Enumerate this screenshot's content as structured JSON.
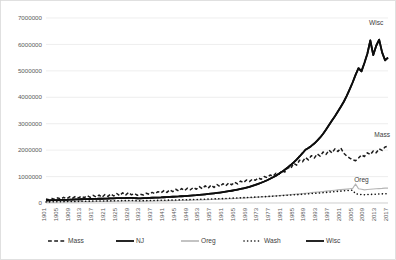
{
  "chart_data": {
    "type": "line",
    "title": "",
    "xlabel": "",
    "ylabel": "",
    "ylim": [
      0,
      7000000
    ],
    "xlim": [
      1901,
      2017
    ],
    "grid": true,
    "legend_position": "bottom",
    "ytick_labels": [
      "7000000",
      "6000000",
      "5000000",
      "4000000",
      "3000000",
      "2000000",
      "1000000",
      "0"
    ],
    "ytick_values": [
      7000000,
      6000000,
      5000000,
      4000000,
      3000000,
      2000000,
      1000000,
      0
    ],
    "xtick_labels": [
      "1901",
      "1905",
      "1909",
      "1913",
      "1917",
      "1921",
      "1925",
      "1929",
      "1933",
      "1937",
      "1941",
      "1945",
      "1949",
      "1953",
      "1957",
      "1961",
      "1965",
      "1969",
      "1973",
      "1977",
      "1981",
      "1985",
      "1989",
      "1993",
      "1997",
      "2001",
      "2005",
      "2009",
      "2013",
      "2017"
    ],
    "xtick_values": [
      1901,
      1905,
      1909,
      1913,
      1917,
      1921,
      1925,
      1929,
      1933,
      1937,
      1941,
      1945,
      1949,
      1953,
      1957,
      1961,
      1965,
      1969,
      1973,
      1977,
      1981,
      1985,
      1989,
      1993,
      1997,
      2001,
      2005,
      2009,
      2013,
      2017
    ],
    "x": [
      1901,
      1902,
      1903,
      1904,
      1905,
      1906,
      1907,
      1908,
      1909,
      1910,
      1911,
      1912,
      1913,
      1914,
      1915,
      1916,
      1917,
      1918,
      1919,
      1920,
      1921,
      1922,
      1923,
      1924,
      1925,
      1926,
      1927,
      1928,
      1929,
      1930,
      1931,
      1932,
      1933,
      1934,
      1935,
      1936,
      1937,
      1938,
      1939,
      1940,
      1941,
      1942,
      1943,
      1944,
      1945,
      1946,
      1947,
      1948,
      1949,
      1950,
      1951,
      1952,
      1953,
      1954,
      1955,
      1956,
      1957,
      1958,
      1959,
      1960,
      1961,
      1962,
      1963,
      1964,
      1965,
      1966,
      1967,
      1968,
      1969,
      1970,
      1971,
      1972,
      1973,
      1974,
      1975,
      1976,
      1977,
      1978,
      1979,
      1980,
      1981,
      1982,
      1983,
      1984,
      1985,
      1986,
      1987,
      1988,
      1989,
      1990,
      1991,
      1992,
      1993,
      1994,
      1995,
      1996,
      1997,
      1998,
      1999,
      2000,
      2001,
      2002,
      2003,
      2004,
      2005,
      2006,
      2007,
      2008,
      2009,
      2010,
      2011,
      2012,
      2013,
      2014,
      2015,
      2016,
      2017
    ],
    "series": [
      {
        "name": "Mass",
        "legend_label": "Mass",
        "inline_label": "Mass",
        "color": "#1a1a1a",
        "style": "dashed",
        "width": 1.5,
        "values": [
          150000,
          120000,
          175000,
          130000,
          195000,
          150000,
          215000,
          160000,
          235000,
          180000,
          250000,
          195000,
          260000,
          200000,
          275000,
          215000,
          290000,
          230000,
          300000,
          215000,
          320000,
          250000,
          345000,
          265000,
          360000,
          280000,
          385000,
          300000,
          400000,
          310000,
          360000,
          290000,
          330000,
          300000,
          370000,
          330000,
          400000,
          350000,
          430000,
          380000,
          470000,
          400000,
          500000,
          430000,
          520000,
          450000,
          545000,
          470000,
          560000,
          500000,
          590000,
          520000,
          620000,
          540000,
          650000,
          560000,
          680000,
          590000,
          700000,
          620000,
          730000,
          650000,
          760000,
          690000,
          790000,
          720000,
          830000,
          770000,
          870000,
          810000,
          900000,
          860000,
          950000,
          900000,
          1000000,
          960000,
          1060000,
          1010000,
          1130000,
          1090000,
          1220000,
          1170000,
          1340000,
          1300000,
          1500000,
          1430000,
          1620000,
          1560000,
          1720000,
          1630000,
          1790000,
          1700000,
          1860000,
          1770000,
          1930000,
          1840000,
          2000000,
          1890000,
          2050000,
          1950000,
          2080000,
          1880000,
          1780000,
          1700000,
          1640000,
          1600000,
          1700000,
          1820000,
          1760000,
          1900000,
          1830000,
          1970000,
          1900000,
          2050000,
          1990000,
          2120000,
          2150000
        ]
      },
      {
        "name": "NJ",
        "legend_label": "NJ",
        "inline_label": "",
        "color": "#0d0d0d",
        "style": "solid",
        "width": 1.8,
        "values": [
          95000,
          100000,
          105000,
          110000,
          112000,
          116000,
          120000,
          122000,
          128000,
          130000,
          135000,
          138000,
          142000,
          145000,
          148000,
          152000,
          156000,
          158000,
          162000,
          160000,
          168000,
          170000,
          175000,
          178000,
          182000,
          185000,
          188000,
          190000,
          195000,
          192000,
          185000,
          180000,
          178000,
          182000,
          188000,
          192000,
          198000,
          200000,
          205000,
          210000,
          218000,
          222000,
          230000,
          236000,
          242000,
          248000,
          256000,
          262000,
          270000,
          278000,
          288000,
          296000,
          308000,
          318000,
          330000,
          342000,
          356000,
          368000,
          382000,
          396000,
          412000,
          428000,
          446000,
          464000,
          484000,
          506000,
          530000,
          556000,
          584000,
          614000,
          648000,
          684000,
          724000,
          766000,
          812000,
          862000,
          916000,
          974000,
          1036000,
          1104000,
          1178000,
          1258000,
          1344000,
          1436000,
          1536000,
          1644000,
          1760000,
          1884000,
          2016000,
          2080000,
          2160000,
          2250000,
          2360000,
          2480000,
          2620000,
          2780000,
          2950000,
          3120000,
          3280000,
          3460000,
          3640000,
          3830000,
          4050000,
          4300000,
          4560000,
          4850000,
          5100000,
          4980000,
          5300000,
          5650000,
          6150000,
          5600000,
          5950000,
          6180000,
          5700000,
          5400000,
          5500000
        ]
      },
      {
        "name": "Oreg",
        "legend_label": "Oreg",
        "inline_label": "Oreg",
        "color": "#b5b5b5",
        "style": "solid",
        "width": 1.2,
        "values": [
          30000,
          32000,
          34000,
          35000,
          37000,
          38000,
          40000,
          41000,
          43000,
          44000,
          46000,
          47000,
          49000,
          50000,
          52000,
          53000,
          55000,
          56000,
          58000,
          57000,
          60000,
          61000,
          63000,
          64000,
          66000,
          67000,
          69000,
          70000,
          72000,
          71000,
          68000,
          66000,
          65000,
          67000,
          69000,
          71000,
          73000,
          75000,
          77000,
          79000,
          82000,
          84000,
          87000,
          89000,
          92000,
          94000,
          97000,
          100000,
          103000,
          106000,
          110000,
          113000,
          117000,
          120000,
          124000,
          128000,
          132000,
          136000,
          140000,
          145000,
          150000,
          155000,
          160000,
          165000,
          170000,
          176000,
          182000,
          188000,
          194000,
          200000,
          207000,
          214000,
          221000,
          228000,
          236000,
          244000,
          252000,
          260000,
          269000,
          278000,
          287000,
          296000,
          306000,
          316000,
          326000,
          336000,
          346000,
          357000,
          368000,
          379000,
          390000,
          400000,
          412000,
          424000,
          436000,
          448000,
          460000,
          470000,
          482000,
          494000,
          505000,
          516000,
          528000,
          540000,
          550000,
          720000,
          540000,
          520000,
          500000,
          510000,
          520000,
          530000,
          540000,
          545000,
          550000,
          560000,
          565000
        ]
      },
      {
        "name": "Wash",
        "legend_label": "Wash",
        "inline_label": "",
        "color": "#111111",
        "style": "dotted",
        "width": 1.6,
        "values": [
          40000,
          42000,
          44000,
          46000,
          48000,
          50000,
          52000,
          54000,
          56000,
          58000,
          60000,
          62000,
          64000,
          66000,
          68000,
          70000,
          72000,
          74000,
          76000,
          75000,
          78000,
          80000,
          82000,
          84000,
          86000,
          88000,
          90000,
          92000,
          94000,
          93000,
          90000,
          88000,
          87000,
          89000,
          91000,
          93000,
          95000,
          97000,
          99000,
          101000,
          104000,
          106000,
          109000,
          111000,
          114000,
          116000,
          119000,
          122000,
          125000,
          128000,
          131000,
          134000,
          138000,
          141000,
          145000,
          148000,
          152000,
          156000,
          160000,
          164000,
          168000,
          172000,
          177000,
          181000,
          186000,
          191000,
          196000,
          201000,
          206000,
          211000,
          217000,
          222000,
          228000,
          234000,
          240000,
          246000,
          252000,
          259000,
          265000,
          272000,
          279000,
          286000,
          293000,
          300000,
          308000,
          315000,
          323000,
          331000,
          339000,
          347000,
          356000,
          364000,
          373000,
          382000,
          391000,
          400000,
          410000,
          420000,
          430000,
          440000,
          450000,
          460000,
          468000,
          476000,
          484000,
          350000,
          330000,
          320000,
          315000,
          320000,
          325000,
          330000,
          335000,
          340000,
          345000,
          350000,
          355000
        ]
      },
      {
        "name": "Wisc",
        "legend_label": "Wisc",
        "inline_label": "Wisc",
        "color": "#0d0d0d",
        "style": "solid",
        "width": 1.8,
        "values": [
          95000,
          100000,
          105000,
          110000,
          112000,
          116000,
          120000,
          122000,
          128000,
          130000,
          135000,
          138000,
          142000,
          145000,
          148000,
          152000,
          156000,
          158000,
          162000,
          160000,
          168000,
          170000,
          175000,
          178000,
          182000,
          185000,
          188000,
          190000,
          195000,
          192000,
          185000,
          180000,
          178000,
          182000,
          188000,
          192000,
          198000,
          200000,
          205000,
          210000,
          218000,
          222000,
          230000,
          236000,
          242000,
          248000,
          256000,
          262000,
          270000,
          278000,
          288000,
          296000,
          308000,
          318000,
          330000,
          342000,
          356000,
          368000,
          382000,
          396000,
          412000,
          428000,
          446000,
          464000,
          484000,
          506000,
          530000,
          556000,
          584000,
          614000,
          648000,
          684000,
          724000,
          766000,
          812000,
          862000,
          916000,
          974000,
          1036000,
          1104000,
          1178000,
          1258000,
          1344000,
          1436000,
          1536000,
          1644000,
          1760000,
          1884000,
          2016000,
          2080000,
          2160000,
          2250000,
          2360000,
          2480000,
          2620000,
          2780000,
          2950000,
          3120000,
          3280000,
          3460000,
          3640000,
          3830000,
          4050000,
          4300000,
          4560000,
          4850000,
          5100000,
          4980000,
          5300000,
          5650000,
          6150000,
          5600000,
          5950000,
          6180000,
          5700000,
          5400000,
          5500000
        ]
      }
    ],
    "inline_annotations": [
      {
        "text": "Wisc",
        "x": 2013,
        "y": 6750000
      },
      {
        "text": "Mass",
        "x": 2015,
        "y": 2480000
      },
      {
        "text": "Oreg",
        "x": 2008,
        "y": 780000
      }
    ]
  }
}
